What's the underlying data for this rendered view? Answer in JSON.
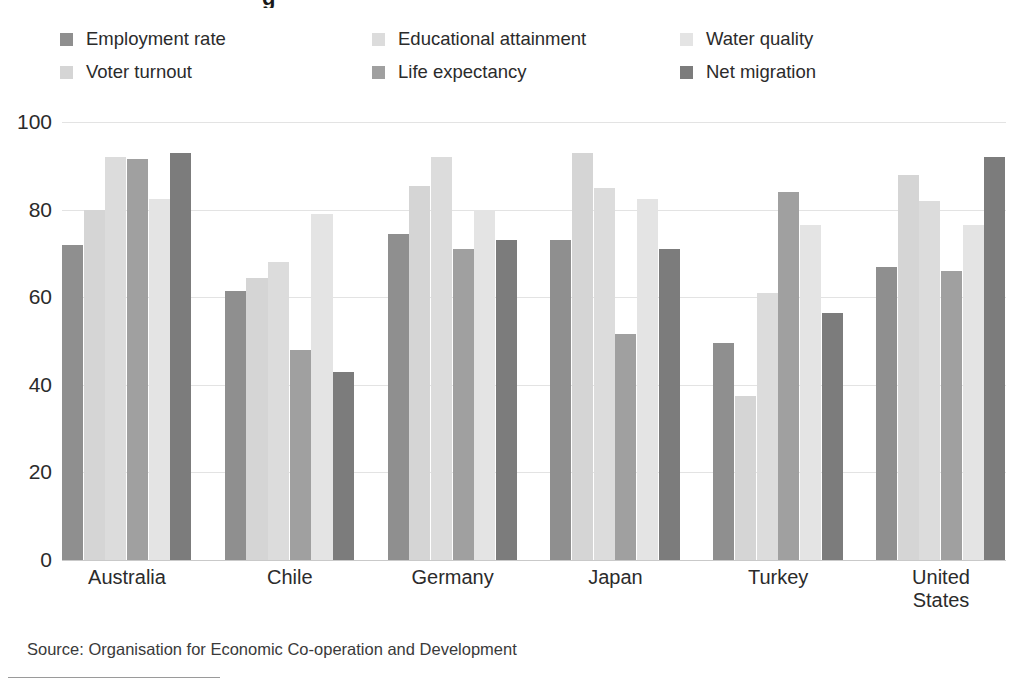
{
  "title_remnant": "g",
  "source": "Source: Organisation for Economic Co-operation and Development",
  "legend": {
    "items": [
      {
        "label": "Employment rate",
        "color": "#8f8f8f"
      },
      {
        "label": "Voter turnout",
        "color": "#d5d5d5"
      },
      {
        "label": "Educational attainment",
        "color": "#dcdcdc"
      },
      {
        "label": "Life expectancy",
        "color": "#a0a0a0"
      },
      {
        "label": "Water quality",
        "color": "#e4e4e4"
      },
      {
        "label": "Net migration",
        "color": "#7c7c7c"
      }
    ]
  },
  "chart_data": {
    "type": "bar",
    "title": "",
    "subtitle": "",
    "xlabel": "",
    "ylabel": "",
    "ylim": [
      0,
      100
    ],
    "yticks": [
      0,
      20,
      40,
      60,
      80,
      100
    ],
    "ytick_labels": [
      "0",
      "20",
      "40",
      "60",
      "80",
      "100"
    ],
    "grid": true,
    "legend_position": "top",
    "categories": [
      "Australia",
      "Chile",
      "Germany",
      "Japan",
      "Turkey",
      "United\nStates"
    ],
    "series": [
      {
        "name": "Employment rate",
        "color": "#8f8f8f",
        "values": [
          72,
          61.5,
          74.5,
          73,
          49.5,
          67
        ]
      },
      {
        "name": "Voter turnout",
        "color": "#d5d5d5",
        "values": [
          80,
          64.5,
          85.5,
          93,
          37.5,
          88
        ]
      },
      {
        "name": "Educational attainment",
        "color": "#dcdcdc",
        "values": [
          92,
          68,
          92,
          85,
          61,
          82
        ]
      },
      {
        "name": "Life expectancy",
        "color": "#a0a0a0",
        "values": [
          91.5,
          48,
          71,
          51.5,
          84,
          66
        ]
      },
      {
        "name": "Water quality",
        "color": "#e4e4e4",
        "values": [
          82.5,
          79,
          80,
          82.5,
          76.5,
          76.5
        ]
      },
      {
        "name": "Net migration",
        "color": "#7c7c7c",
        "values": [
          93,
          43,
          73,
          71,
          56.5,
          92
        ]
      }
    ]
  }
}
